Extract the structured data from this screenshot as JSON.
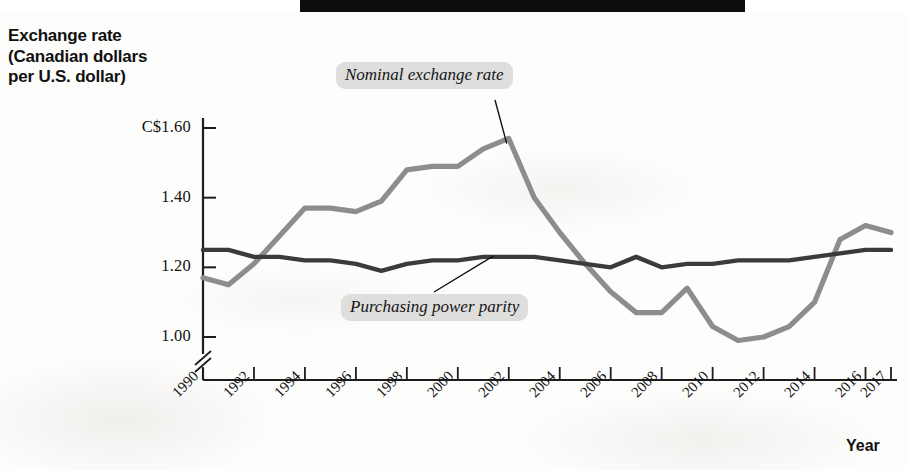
{
  "figure": {
    "y_axis_title_lines": [
      "Exchange rate",
      "(Canadian dollars",
      "per U.S. dollar)"
    ],
    "x_axis_title": "Year",
    "line_colors": {
      "nominal": "#8d8d8d",
      "ppp": "#3b3b3b"
    },
    "annotation_bg": "#dededd",
    "axis_color": "#1d1d1d"
  },
  "chart_data": {
    "type": "line",
    "title": "",
    "xlabel": "Year",
    "ylabel": "Exchange rate (Canadian dollars per U.S. dollar)",
    "xlim": [
      1990,
      2017
    ],
    "ylim": [
      0.95,
      1.65
    ],
    "y_axis_break": true,
    "y_ticks": [
      1.0,
      1.2,
      1.4,
      1.6
    ],
    "y_tick_labels": [
      "1.00",
      "1.20",
      "1.40",
      "C$1.60"
    ],
    "x_ticks": [
      1990,
      1992,
      1994,
      1996,
      1998,
      2000,
      2002,
      2004,
      2006,
      2008,
      2010,
      2012,
      2014,
      2016,
      2017
    ],
    "x_tick_labels": [
      "1990",
      "1992",
      "1994",
      "1996",
      "1998",
      "2000",
      "2002",
      "2004",
      "2006",
      "2008",
      "2010",
      "2012",
      "2014",
      "2016",
      "2017"
    ],
    "grid": false,
    "legend": "inline-annotations",
    "x": [
      1990,
      1991,
      1992,
      1993,
      1994,
      1995,
      1996,
      1997,
      1998,
      1999,
      2000,
      2001,
      2002,
      2003,
      2004,
      2005,
      2006,
      2007,
      2008,
      2009,
      2010,
      2011,
      2012,
      2013,
      2014,
      2015,
      2016,
      2017
    ],
    "series": [
      {
        "name": "Nominal exchange rate",
        "color": "#8d8d8d",
        "values": [
          1.17,
          1.15,
          1.21,
          1.29,
          1.37,
          1.37,
          1.36,
          1.39,
          1.48,
          1.49,
          1.49,
          1.54,
          1.57,
          1.4,
          1.3,
          1.21,
          1.13,
          1.07,
          1.07,
          1.14,
          1.03,
          0.99,
          1.0,
          1.03,
          1.1,
          1.28,
          1.32,
          1.3
        ]
      },
      {
        "name": "Purchasing power parity",
        "color": "#3b3b3b",
        "values": [
          1.25,
          1.25,
          1.23,
          1.23,
          1.22,
          1.22,
          1.21,
          1.19,
          1.21,
          1.22,
          1.22,
          1.23,
          1.23,
          1.23,
          1.22,
          1.21,
          1.2,
          1.23,
          1.2,
          1.21,
          1.21,
          1.22,
          1.22,
          1.22,
          1.23,
          1.24,
          1.25,
          1.25
        ]
      }
    ],
    "annotations": [
      {
        "text": "Nominal exchange rate",
        "points_to_year": 2002,
        "points_to_value": 1.56
      },
      {
        "text": "Purchasing power parity",
        "points_to_year": 2002,
        "points_to_value": 1.23
      }
    ]
  }
}
